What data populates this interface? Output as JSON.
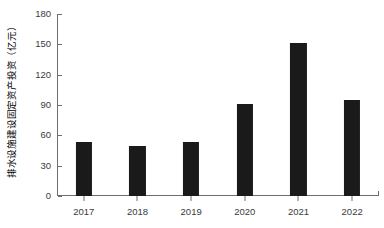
{
  "chart_data": {
    "type": "bar",
    "title": "",
    "subtitle": "",
    "xlabel": "",
    "ylabel": "排水设施建设固定资产投资（亿元）",
    "categories": [
      "2017",
      "2018",
      "2019",
      "2020",
      "2021",
      "2022"
    ],
    "values": [
      53,
      49,
      53,
      91,
      151,
      95
    ],
    "series": [
      {
        "name": "排水设施建设固定资产投资",
        "values": [
          53,
          49,
          53,
          91,
          151,
          95
        ]
      }
    ],
    "ylim": [
      0,
      180
    ],
    "xlim_categories": 6,
    "y_ticks": [
      0,
      30,
      60,
      90,
      120,
      150,
      180
    ],
    "y_tick_labels": [
      "0",
      "30",
      "60",
      "90",
      "120",
      "150",
      "180"
    ],
    "x_tick_labels": [
      "2017",
      "2018",
      "2019",
      "2020",
      "2021",
      "2022"
    ],
    "grid": false,
    "legend": false,
    "legend_position": "none",
    "bar_color": "#1a1a1a",
    "axis_color": "#6e6e6e",
    "tick_label_color": "#3a3a3a",
    "background_color": "#ffffff",
    "bar_width_fraction": 0.3,
    "annotations": []
  }
}
